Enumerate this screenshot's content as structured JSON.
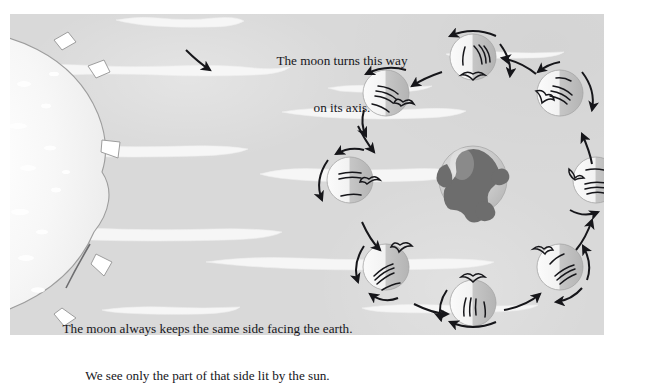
{
  "figure": {
    "kind": "astronomy-diagram",
    "background_color": "#d9d9d9",
    "page_color": "#ffffff",
    "ink_color": "#15151a"
  },
  "captions": {
    "top": {
      "line1": "The moon turns this way",
      "line2": "on its axis."
    },
    "bottom": {
      "line1": "The moon always keeps the same side facing the earth.",
      "line2": "We see only the part of that side lit by the sun."
    }
  },
  "bodies": {
    "sun": {
      "label": "sun",
      "position": "left-edge",
      "note": "large pale sphere cropped by the left edge of the panel",
      "fill": "#f4f4f4",
      "outline": "#9a9a9a"
    },
    "earth": {
      "label": "earth",
      "cx": 473,
      "cy": 180,
      "r": 34,
      "fill": "#cfcfcf",
      "continent_color": "#6a6a6a"
    },
    "moons": [
      {
        "index": 1,
        "label": "moon-position-1",
        "cx": 473,
        "cy": 57,
        "r": 23,
        "lit_side": "left",
        "marker_angle": 90
      },
      {
        "index": 2,
        "label": "moon-position-2",
        "cx": 560,
        "cy": 93,
        "r": 23,
        "lit_side": "left",
        "marker_angle": 135
      },
      {
        "index": 3,
        "label": "moon-position-3",
        "cx": 596,
        "cy": 180,
        "r": 23,
        "lit_side": "left",
        "marker_angle": 180
      },
      {
        "index": 4,
        "label": "moon-position-4",
        "cx": 560,
        "cy": 267,
        "r": 23,
        "lit_side": "left",
        "marker_angle": 225
      },
      {
        "index": 5,
        "label": "moon-position-5",
        "cx": 473,
        "cy": 303,
        "r": 23,
        "lit_side": "left",
        "marker_angle": 270
      },
      {
        "index": 6,
        "label": "moon-position-6",
        "cx": 386,
        "cy": 267,
        "r": 23,
        "lit_side": "left",
        "marker_angle": 315
      },
      {
        "index": 7,
        "label": "moon-position-7",
        "cx": 350,
        "cy": 180,
        "r": 23,
        "lit_side": "left",
        "marker_angle": 0
      },
      {
        "index": 8,
        "label": "moon-position-8",
        "cx": 386,
        "cy": 93,
        "r": 23,
        "lit_side": "left",
        "marker_angle": 45
      }
    ]
  },
  "annotations": {
    "orbit_direction": "counterclockwise",
    "rotation_arrow_label": "moon rotation on its axis",
    "orbit_arrow_label": "orbit travel direction",
    "pointer_label": "caption pointer to moon"
  },
  "light_rays": {
    "label": "sunlight rays",
    "color": "#f7f7f7",
    "count": 11
  }
}
